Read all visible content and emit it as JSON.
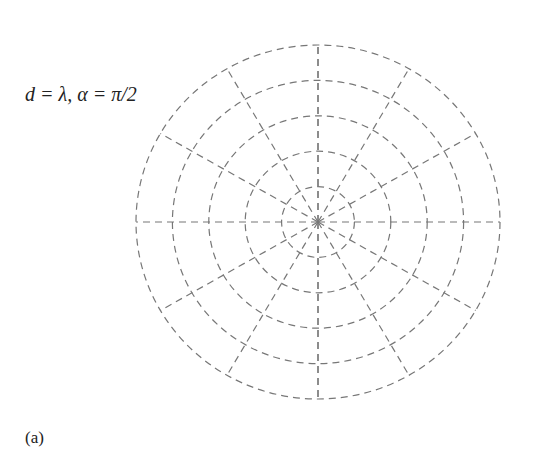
{
  "chart_data": {
    "type": "polar-line",
    "title": "",
    "annotation": "d = λ, α = π/2",
    "caption": "(a)",
    "angle_convention": "degrees measured from vertical (0 at top), symmetric left/right",
    "angular_ticks": [
      0,
      30,
      60,
      90,
      120,
      150,
      180
    ],
    "angular_tick_labels_left": [
      "30",
      "60",
      "90",
      "120",
      "150"
    ],
    "angular_tick_labels_right": [
      "30",
      "60",
      "90",
      "120",
      "150"
    ],
    "radial_ticks": [
      0.2,
      0.4,
      0.6,
      0.8,
      1
    ],
    "radial_tick_labels": [
      "0.2",
      "0.4",
      "0.6",
      "0.8",
      "1"
    ],
    "rlim": [
      0,
      1
    ],
    "grid": true,
    "series": [
      {
        "name": "array factor",
        "expression": "|cos(π·cosθ + π/4)|",
        "theta_deg": [
          0,
          15,
          30,
          41.4,
          50,
          60,
          75.5,
          90,
          104.5,
          120,
          138.6,
          150,
          165,
          180
        ],
        "r": [
          0.707,
          0.79,
          0.97,
          1.0,
          0.95,
          0.71,
          0.0,
          0.71,
          1.0,
          0.71,
          0.0,
          0.37,
          0.64,
          0.707
        ],
        "color": "#444444"
      }
    ]
  },
  "labels": {
    "annotation": "d = λ, α = π/2",
    "caption": "(a)"
  }
}
